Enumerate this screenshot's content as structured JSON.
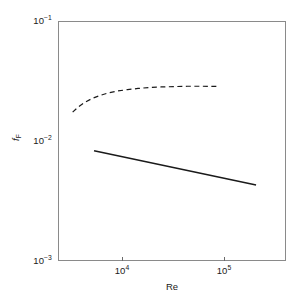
{
  "chart_data": {
    "type": "line",
    "title": "",
    "xlabel": "Re",
    "ylabel": "f_F",
    "xscale": "log",
    "yscale": "log",
    "xlim": [
      4000,
      320000
    ],
    "ylim": [
      0.001,
      0.1
    ],
    "grid": false,
    "legend": "none",
    "xticks": [
      10000,
      100000
    ],
    "xtick_labels": [
      "10",
      "10"
    ],
    "xtick_exponents": [
      "4",
      "5"
    ],
    "yticks": [
      0.1,
      0.01,
      0.001
    ],
    "ytick_labels": [
      "10",
      "10",
      "10"
    ],
    "ytick_exponents": [
      "-1",
      "-2",
      "-3"
    ],
    "series": [
      {
        "name": "dashed-curve",
        "style": "dashed",
        "color": "#1a1a1a",
        "x": [
          5300,
          5900,
          6700,
          7700,
          9000,
          10600,
          12600,
          15200,
          18600,
          23000,
          29000,
          37000,
          48000,
          63000,
          89000
        ],
        "y": [
          0.0174,
          0.0192,
          0.021,
          0.0226,
          0.024,
          0.0252,
          0.0261,
          0.0268,
          0.0274,
          0.0279,
          0.0282,
          0.0284,
          0.0286,
          0.0286,
          0.0285
        ]
      },
      {
        "name": "solid-line",
        "style": "solid",
        "color": "#1a1a1a",
        "x": [
          8000,
          180000
        ],
        "y": [
          0.0083,
          0.0043
        ]
      }
    ]
  },
  "axes": {
    "y_title_base": "f",
    "y_title_sub": "F",
    "x_title": "Re",
    "y_tick_0_mantissa": "10",
    "y_tick_0_exp": "−1",
    "y_tick_1_mantissa": "10",
    "y_tick_1_exp": "−2",
    "y_tick_2_mantissa": "10",
    "y_tick_2_exp": "−3",
    "x_tick_0_mantissa": "10",
    "x_tick_0_exp": "4",
    "x_tick_1_mantissa": "10",
    "x_tick_1_exp": "5"
  },
  "colors": {
    "frame": "#8a8a8a",
    "curve": "#1a1a1a",
    "background": "#ffffff"
  }
}
